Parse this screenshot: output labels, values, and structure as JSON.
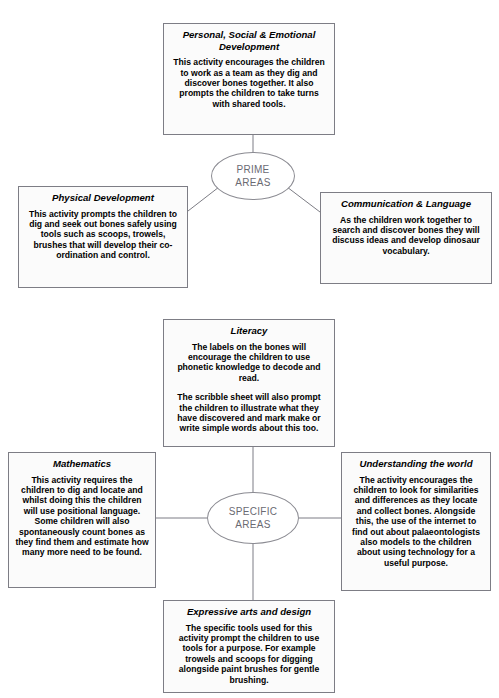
{
  "page": {
    "top_cut_text": "·  ···· ··· ·· ····· ····  ···· ···  ····· ···· ·· ····· ···  ···· ······",
    "line_color": "#7d7d85",
    "box_fill": "#fbfbfb",
    "hub_text_color": "#6a6a72"
  },
  "prime": {
    "hub": {
      "line1": "PRIME",
      "line2": "AREAS"
    },
    "nodes": {
      "psed": {
        "title": "Personal, Social & Emotional Development",
        "body": [
          "This activity encourages the children to work as a team as they dig and discover bones together. It also prompts the children to take turns with shared tools."
        ]
      },
      "physical_development": {
        "title": "Physical Development",
        "body": [
          "This activity prompts the children to dig and seek out bones safely using tools such as scoops, trowels, brushes that will develop their co-ordination and control."
        ]
      },
      "communication_language": {
        "title": "Communication & Language",
        "body": [
          "As the children work together to search and discover bones they will discuss ideas and develop dinosaur vocabulary."
        ]
      }
    }
  },
  "specific": {
    "hub": {
      "line1": "SPECIFIC",
      "line2": "AREAS"
    },
    "nodes": {
      "literacy": {
        "title": "Literacy",
        "body": [
          "The labels on the bones will encourage the children to use phonetic knowledge to decode and read.",
          "The scribble sheet will also prompt the children to illustrate what they have discovered and mark make or write simple words about this too."
        ]
      },
      "mathematics": {
        "title": "Mathematics",
        "body": [
          "This activity requires the children to dig and locate and whilst doing this the children will use positional language. Some children will also spontaneously count bones as they find them and estimate how many more need to be found."
        ]
      },
      "understanding_the_world": {
        "title": "Understanding the world",
        "body": [
          "The activity encourages the children to look for similarities and differences as they locate and collect bones. Alongside this, the use of the internet to find out about palaeontologists also models to the children about using technology for a useful purpose."
        ]
      },
      "expressive_arts_and_design": {
        "title": "Expressive arts and design",
        "body": [
          "The specific tools used for this activity prompt the children to use tools for a purpose. For example trowels and scoops for digging alongside paint brushes for gentle brushing."
        ]
      }
    }
  }
}
